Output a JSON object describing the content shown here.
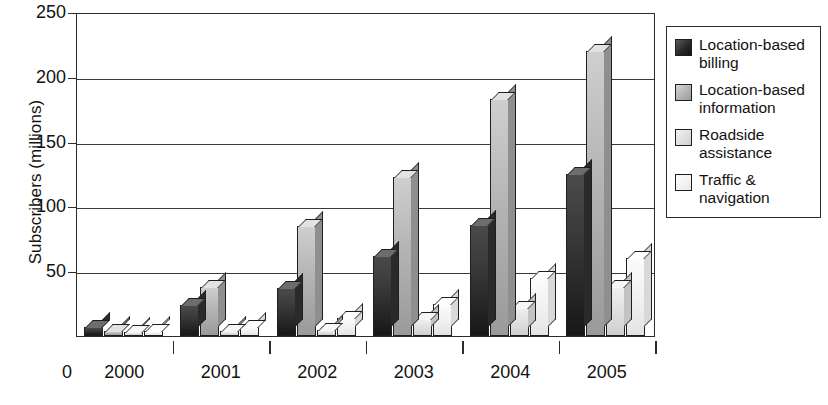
{
  "chart_data": {
    "type": "bar",
    "title": "",
    "xlabel": "",
    "ylabel": "Subscribers (millions)",
    "categories": [
      "2000",
      "2001",
      "2002",
      "2003",
      "2004",
      "2005"
    ],
    "x_axis_origin_label": "0",
    "ylim": [
      0,
      250
    ],
    "y_ticks": [
      0,
      50,
      100,
      150,
      200,
      250
    ],
    "y_tick_labels": [
      "0",
      "50",
      "100",
      "150",
      "200",
      "250"
    ],
    "grid": "horizontal",
    "legend_position": "right",
    "style": "3d-grouped-bars",
    "series": [
      {
        "name": "Location-based billing",
        "color": "#2a2a2a",
        "values": [
          7,
          24,
          37,
          62,
          86,
          125
        ]
      },
      {
        "name": "Location-based information",
        "color": "#b0b0b0",
        "values": [
          4,
          38,
          85,
          123,
          183,
          220
        ]
      },
      {
        "name": "Roadside assistance",
        "color": "#dedede",
        "values": [
          3,
          4,
          5,
          13,
          22,
          38
        ]
      },
      {
        "name": "Traffic & navigation",
        "color": "#f2f2f2",
        "values": [
          4,
          7,
          14,
          25,
          45,
          60
        ]
      }
    ]
  },
  "legend": {
    "items": [
      {
        "label": "Location-based billing"
      },
      {
        "label": "Location-based information"
      },
      {
        "label": "Roadside assistance"
      },
      {
        "label": "Traffic & navigation"
      }
    ]
  }
}
